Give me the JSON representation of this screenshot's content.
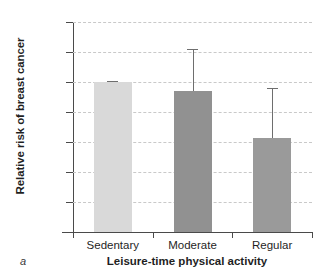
{
  "panel": {
    "label": "a"
  },
  "chart_data": {
    "type": "bar",
    "title": "",
    "categories": [
      "Sedentary",
      "Moderate",
      "Regular"
    ],
    "values": [
      1.0,
      0.94,
      0.63
    ],
    "error_upper": [
      1.01,
      1.22,
      0.96
    ],
    "series": [
      {
        "name": "Relative risk of breast cancer",
        "values": [
          1.0,
          0.94,
          0.63
        ]
      }
    ],
    "bar_colors": [
      "#d9d9d9",
      "#919191",
      "#9a9a9a"
    ],
    "xlabel": "Leisure-time physical activity",
    "ylabel": "Relative risk of breast cancer",
    "ylim": [
      0.0,
      1.4
    ],
    "ytick_labels": [
      "0.0",
      "0.2",
      "0.4",
      "0.6",
      "0.8",
      "1.0",
      "1.2",
      "1.4"
    ],
    "ytick_values": [
      0.0,
      0.2,
      0.4,
      0.6,
      0.8,
      1.0,
      1.2,
      1.4
    ],
    "grid": true,
    "grid_style": "dashed",
    "grid_color": "#c9c9c9",
    "legend": "none",
    "error_bar_direction": "upper-only"
  }
}
